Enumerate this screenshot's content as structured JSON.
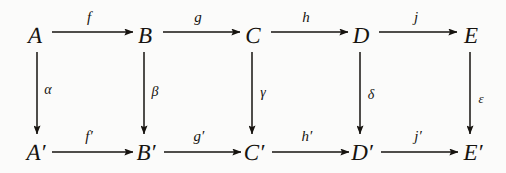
{
  "diagram": {
    "type": "commutative-diagram",
    "background_color": "#fbfbfa",
    "ink_color": "#16130f",
    "rows": 2,
    "columns": 5,
    "nodes": [
      {
        "id": "A",
        "label": "A",
        "x": 35,
        "y": 35,
        "row": "top",
        "column": 1
      },
      {
        "id": "B",
        "label": "B",
        "x": 145,
        "y": 35,
        "row": "top",
        "column": 2
      },
      {
        "id": "C",
        "label": "C",
        "x": 253,
        "y": 35,
        "row": "top",
        "column": 3
      },
      {
        "id": "D",
        "label": "D",
        "x": 361,
        "y": 35,
        "row": "top",
        "column": 4
      },
      {
        "id": "E",
        "label": "E",
        "x": 471,
        "y": 35,
        "row": "top",
        "column": 5
      },
      {
        "id": "A2",
        "label": "A′",
        "x": 36,
        "y": 152,
        "row": "bottom",
        "column": 1
      },
      {
        "id": "B2",
        "label": "B′",
        "x": 146,
        "y": 152,
        "row": "bottom",
        "column": 2
      },
      {
        "id": "C2",
        "label": "C′",
        "x": 254,
        "y": 152,
        "row": "bottom",
        "column": 3
      },
      {
        "id": "D2",
        "label": "D′",
        "x": 362,
        "y": 152,
        "row": "bottom",
        "column": 4
      },
      {
        "id": "E2",
        "label": "E′",
        "x": 473,
        "y": 152,
        "row": "bottom",
        "column": 5
      }
    ],
    "horizontal_arrows": [
      {
        "id": "f",
        "label": "f",
        "from": "A",
        "to": "B",
        "x1": 52,
        "x2": 133,
        "y": 32,
        "label_x": 89,
        "label_y": 17
      },
      {
        "id": "g",
        "label": "g",
        "from": "B",
        "to": "C",
        "x1": 163,
        "x2": 240,
        "y": 32,
        "label_x": 198,
        "label_y": 17
      },
      {
        "id": "h",
        "label": "h",
        "from": "C",
        "to": "D",
        "x1": 271,
        "x2": 348,
        "y": 32,
        "label_x": 306,
        "label_y": 17
      },
      {
        "id": "j",
        "label": "j",
        "from": "D",
        "to": "E",
        "x1": 379,
        "x2": 457,
        "y": 32,
        "label_x": 416,
        "label_y": 17
      },
      {
        "id": "f2",
        "label": "f′",
        "from": "A2",
        "to": "B2",
        "x1": 52,
        "x2": 133,
        "y": 152,
        "label_x": 89,
        "label_y": 136
      },
      {
        "id": "g2",
        "label": "g′",
        "from": "B2",
        "to": "C2",
        "x1": 164,
        "x2": 241,
        "y": 152,
        "label_x": 199,
        "label_y": 136
      },
      {
        "id": "h2",
        "label": "h′",
        "from": "C2",
        "to": "D2",
        "x1": 272,
        "x2": 349,
        "y": 152,
        "label_x": 307,
        "label_y": 136
      },
      {
        "id": "j2",
        "label": "j′",
        "from": "D2",
        "to": "E2",
        "x1": 381,
        "x2": 458,
        "y": 152,
        "label_x": 418,
        "label_y": 136
      }
    ],
    "vertical_arrows": [
      {
        "id": "alpha",
        "label": "α",
        "from": "A",
        "to": "A2",
        "x": 37,
        "y1": 52,
        "y2": 134,
        "label_x": 48,
        "label_y": 90
      },
      {
        "id": "beta",
        "label": "β",
        "from": "B",
        "to": "B2",
        "x": 144,
        "y1": 52,
        "y2": 134,
        "label_x": 155,
        "label_y": 92
      },
      {
        "id": "gamma",
        "label": "γ",
        "from": "C",
        "to": "C2",
        "x": 252,
        "y1": 52,
        "y2": 134,
        "label_x": 263,
        "label_y": 93
      },
      {
        "id": "delta",
        "label": "δ",
        "from": "D",
        "to": "D2",
        "x": 360,
        "y1": 52,
        "y2": 134,
        "label_x": 371,
        "label_y": 95
      },
      {
        "id": "epsilon",
        "label": "ε",
        "from": "E",
        "to": "E2",
        "x": 470,
        "y1": 52,
        "y2": 134,
        "label_x": 481,
        "label_y": 98
      }
    ]
  }
}
